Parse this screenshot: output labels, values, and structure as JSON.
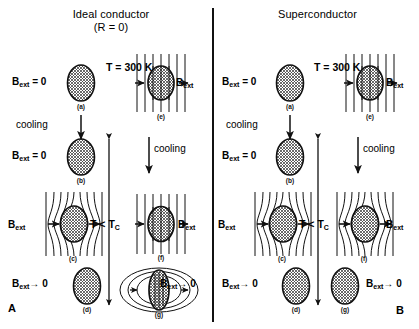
{
  "figure": {
    "width": 419,
    "height": 329,
    "background": "#ffffff",
    "ink": "#000000"
  },
  "panels": {
    "left": {
      "corner_label": "A",
      "title_line1": "Ideal conductor",
      "title_line2": "(R = 0)"
    },
    "right": {
      "corner_label": "B",
      "title_line1": "Superconductor",
      "title_line2": ""
    }
  },
  "shared": {
    "temp_high": "T = 300 K",
    "temp_low_text": "T < T",
    "temp_low_sub": "C",
    "cooling": "cooling",
    "b_symbol": "B",
    "b_sub": "ext",
    "b_zero": "= 0",
    "b_to_zero": "0",
    "arrow_to": "→"
  },
  "states": {
    "left": [
      {
        "id": "a",
        "caption": "(a)",
        "field_label": "B",
        "field_sub": "ext",
        "field_rel": "= 0",
        "field_mode": "none",
        "note": "zero-field cooled start, room temperature"
      },
      {
        "id": "b",
        "caption": "(b)",
        "field_label": "B",
        "field_sub": "ext",
        "field_rel": "= 0",
        "field_mode": "none",
        "note": "after cooling, still zero field"
      },
      {
        "id": "c",
        "caption": "(c)",
        "field_label": "B",
        "field_sub": "ext",
        "field_rel": "",
        "field_mode": "expelled",
        "note": "field applied below Tc, flux excluded"
      },
      {
        "id": "d",
        "caption": "(d)",
        "field_label": "B",
        "field_sub": "ext",
        "field_rel": "→ 0",
        "field_mode": "none",
        "note": "field removed, no trapped flux"
      },
      {
        "id": "e",
        "caption": "(e)",
        "field_label": "B",
        "field_sub": "ext",
        "field_rel": "",
        "field_mode": "penetrating",
        "note": "field applied at room temperature, flux penetrates"
      },
      {
        "id": "f",
        "caption": "(f)",
        "field_label": "B",
        "field_sub": "ext",
        "field_rel": "",
        "field_mode": "penetrating",
        "note": "field-cooled ideal conductor keeps flux inside"
      },
      {
        "id": "g",
        "caption": "(g)",
        "field_label": "B",
        "field_sub": "ext",
        "field_rel": "→ 0",
        "field_mode": "trapped",
        "note": "field removed, flux remains trapped as closed loops"
      }
    ],
    "right": [
      {
        "id": "a",
        "caption": "(a)",
        "field_label": "B",
        "field_sub": "ext",
        "field_rel": "= 0",
        "field_mode": "none",
        "note": "zero-field cooled start, room temperature"
      },
      {
        "id": "b",
        "caption": "(b)",
        "field_label": "B",
        "field_sub": "ext",
        "field_rel": "= 0",
        "field_mode": "none",
        "note": "after cooling, still zero field"
      },
      {
        "id": "c",
        "caption": "(c)",
        "field_label": "B",
        "field_sub": "ext",
        "field_rel": "",
        "field_mode": "expelled",
        "note": "field applied below Tc, flux excluded"
      },
      {
        "id": "d",
        "caption": "(d)",
        "field_label": "B",
        "field_sub": "ext",
        "field_rel": "→ 0",
        "field_mode": "none",
        "note": "field removed, no trapped flux"
      },
      {
        "id": "e",
        "caption": "(e)",
        "field_label": "B",
        "field_sub": "ext",
        "field_rel": "",
        "field_mode": "penetrating",
        "note": "field applied at room temperature, flux penetrates"
      },
      {
        "id": "f",
        "caption": "(f)",
        "field_label": "B",
        "field_sub": "ext",
        "field_rel": "",
        "field_mode": "expelled",
        "note": "Meissner effect: flux expelled on field cooling"
      },
      {
        "id": "g",
        "caption": "(g)",
        "field_label": "B",
        "field_sub": "ext",
        "field_rel": "→ 0",
        "field_mode": "none",
        "note": "field removed, no trapped flux remains"
      }
    ]
  }
}
